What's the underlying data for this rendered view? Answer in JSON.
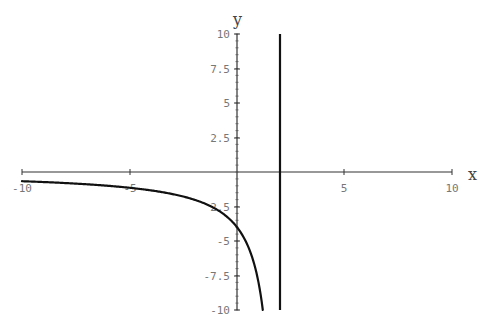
{
  "chart_data": {
    "type": "line",
    "title": "",
    "xlabel": "x",
    "ylabel": "y",
    "xlim": [
      -10,
      10
    ],
    "ylim": [
      -10,
      10
    ],
    "grid": false,
    "legend": null,
    "x_ticks": [
      -10,
      -5,
      5,
      10
    ],
    "x_tick_labels": [
      "-10",
      "-5",
      "5",
      "10"
    ],
    "y_ticks": [
      10,
      7.5,
      5,
      2.5,
      -2.5,
      -5,
      -7.5,
      -10
    ],
    "y_tick_labels": [
      "10",
      "7.5",
      "5",
      "2.5",
      "2.5",
      "-5",
      "-7.5",
      "-10"
    ],
    "series": [
      {
        "name": "curve",
        "description": "Branch of y = 8/(x-2) for x < 2, drawn from x=-10 to x~1.25",
        "x": [
          -10,
          -8,
          -6,
          -4,
          -2,
          -1,
          0,
          0.5,
          1,
          1.25
        ],
        "y": [
          -0.67,
          -0.8,
          -1.0,
          -1.33,
          -2.0,
          -2.67,
          -4.0,
          -5.33,
          -8.0,
          -10.0
        ]
      },
      {
        "name": "vertical-line",
        "description": "Vertical segment at x = 2 spanning y from -10 to 10",
        "x": [
          2,
          2
        ],
        "y": [
          -10,
          10
        ]
      }
    ],
    "colors": {
      "curve": "#111111",
      "axes": "#333333",
      "labels": "#777777"
    }
  }
}
